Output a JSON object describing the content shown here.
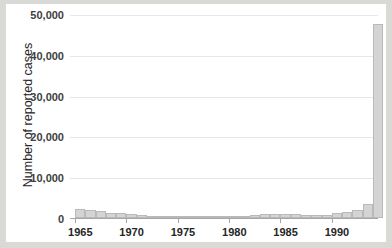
{
  "chart_data": {
    "type": "bar",
    "title": "",
    "subtitle": "",
    "xlabel": "",
    "ylabel": "Number of reported cases",
    "ylim": [
      0,
      50000
    ],
    "ytick_labels": [
      "0",
      "10,000",
      "20,000",
      "30,000",
      "40,000",
      "50,000"
    ],
    "ytick_values": [
      0,
      10000,
      20000,
      30000,
      40000,
      50000
    ],
    "xtick_labels": [
      "1965",
      "1970",
      "1975",
      "1980",
      "1985",
      "1990"
    ],
    "xtick_values": [
      1965,
      1970,
      1975,
      1980,
      1985,
      1990
    ],
    "xlim": [
      1964.5,
      1994.5
    ],
    "grid": "horizontal",
    "legend": "none",
    "bar_color": "#d4d4d4",
    "bar_edge_color": "#b9b9b9",
    "categories": [
      "1965",
      "1966",
      "1967",
      "1968",
      "1969",
      "1970",
      "1971",
      "1972",
      "1973",
      "1974",
      "1975",
      "1976",
      "1977",
      "1978",
      "1979",
      "1980",
      "1981",
      "1982",
      "1983",
      "1984",
      "1985",
      "1986",
      "1987",
      "1988",
      "1989",
      "1990",
      "1991",
      "1992",
      "1993",
      "1994"
    ],
    "values": [
      2100,
      1900,
      1600,
      1350,
      1150,
      900,
      700,
      450,
      300,
      250,
      200,
      180,
      170,
      160,
      300,
      450,
      600,
      800,
      1000,
      1000,
      950,
      900,
      750,
      700,
      650,
      1200,
      1500,
      2000,
      3500,
      14800
    ],
    "values_note": "final bar reaches 47,500",
    "last_value": 47500
  },
  "figure": {
    "background": "#ffffff",
    "page_background": "#d9d9d5",
    "gridline_color": "#e6e6e6",
    "axis_color": "#a6a6a6"
  }
}
